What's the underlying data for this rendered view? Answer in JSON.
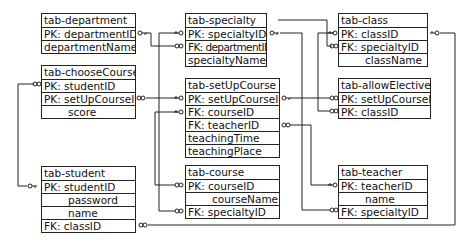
{
  "diagram": {
    "type": "entity-relationship",
    "tables": [
      {
        "id": "department",
        "title": "tab-department",
        "fields": [
          "PK: departmentID",
          "departmentName"
        ]
      },
      {
        "id": "chooseCourse",
        "title": "tab-chooseCourse",
        "fields": [
          "PK: studentID",
          "PK: setUpCourseID",
          "score"
        ]
      },
      {
        "id": "student",
        "title": "tab-student",
        "fields": [
          "PK: studentID",
          "password",
          "name",
          "FK: classID"
        ]
      },
      {
        "id": "specialty",
        "title": "tab-specialty",
        "fields": [
          "PK: specialtyID",
          "FK: departmentID",
          "specialtyName"
        ]
      },
      {
        "id": "setUpCourse",
        "title": "tab-setUpCourse",
        "fields": [
          "PK: setUpCourseID",
          "FK: courseID",
          "FK: teacherID",
          "teachingTime",
          "teachingPlace"
        ]
      },
      {
        "id": "course",
        "title": "tab-course",
        "fields": [
          "PK: courseID",
          "courseName",
          "FK: specialtyID"
        ]
      },
      {
        "id": "class",
        "title": "tab-class",
        "fields": [
          "PK: classID",
          "FK: specialtyID",
          "className"
        ]
      },
      {
        "id": "allowElective",
        "title": "tab-allowElective",
        "fields": [
          "PK: setUpCourseID",
          "PK: classID"
        ]
      },
      {
        "id": "teacher",
        "title": "tab-teacher",
        "fields": [
          "PK: teacherID",
          "name",
          "FK: specialtyID"
        ]
      }
    ],
    "relationships": [
      {
        "from": "department.departmentID",
        "to": "specialty.departmentID",
        "cardinality": "one-to-many"
      },
      {
        "from": "specialty.specialtyID",
        "to": "class.specialtyID",
        "cardinality": "one-to-many"
      },
      {
        "from": "specialty.specialtyID",
        "to": "course.specialtyID",
        "cardinality": "one-to-many"
      },
      {
        "from": "specialty.specialtyID",
        "to": "teacher.specialtyID",
        "cardinality": "one-to-many"
      },
      {
        "from": "setUpCourse.setUpCourseID",
        "to": "chooseCourse.setUpCourseID",
        "cardinality": "one-to-many"
      },
      {
        "from": "setUpCourse.setUpCourseID",
        "to": "allowElective.setUpCourseID",
        "cardinality": "one-to-many"
      },
      {
        "from": "course.courseID",
        "to": "setUpCourse.courseID",
        "cardinality": "one-to-many"
      },
      {
        "from": "teacher.teacherID",
        "to": "setUpCourse.teacherID",
        "cardinality": "one-to-many"
      },
      {
        "from": "student.studentID",
        "to": "chooseCourse.studentID",
        "cardinality": "one-to-many"
      },
      {
        "from": "class.classID",
        "to": "student.classID",
        "cardinality": "one-to-many"
      },
      {
        "from": "class.classID",
        "to": "allowElective.classID",
        "cardinality": "one-to-many"
      }
    ],
    "colors": {
      "line": "#222222",
      "background": "#ffffff"
    }
  },
  "t": {
    "department": {
      "title": "tab-department",
      "f0": "PK: departmentID",
      "f1": "departmentName"
    },
    "chooseCourse": {
      "title": "tab-chooseCourse",
      "f0": "PK: studentID",
      "f1": "PK: setUpCourseID",
      "f2": "score"
    },
    "student": {
      "title": "tab-student",
      "f0": "PK: studentID",
      "f1": "password",
      "f2": "name",
      "f3": "FK: classID"
    },
    "specialty": {
      "title": "tab-specialty",
      "f0": "PK: specialtyID",
      "f1": "FK: departmentID",
      "f2": "specialtyName"
    },
    "setUpCourse": {
      "title": "tab-setUpCourse",
      "f0": "PK: setUpCourseID",
      "f1": "FK: courseID",
      "f2": "FK: teacherID",
      "f3": "teachingTime",
      "f4": "teachingPlace"
    },
    "course": {
      "title": "tab-course",
      "f0": "PK: courseID",
      "f1": "courseName",
      "f2": "FK: specialtyID"
    },
    "class": {
      "title": "tab-class",
      "f0": "PK: classID",
      "f1": "FK: specialtyID",
      "f2": "className"
    },
    "allowElective": {
      "title": "tab-allowElective",
      "f0": "PK: setUpCourseID",
      "f1": "PK: classID"
    },
    "teacher": {
      "title": "tab-teacher",
      "f0": "PK: teacherID",
      "f1": "name",
      "f2": "FK: specialtyID"
    }
  }
}
